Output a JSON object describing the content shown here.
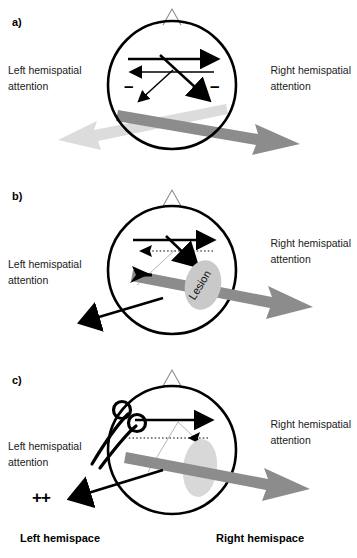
{
  "figure": {
    "background": "#ffffff"
  },
  "colors": {
    "stroke": "#000000",
    "dark_gray_arrow": "#8c8c8c",
    "light_gray_arrow": "#dcdcdc",
    "lesion_fill_b": "#c9c9c9",
    "lesion_fill_c": "#d8d8d8",
    "faint_line": "#b5b5b5",
    "nose_stroke": "#8a8a8a",
    "text": "#1a1a1a"
  },
  "panels": [
    {
      "id": "a",
      "label": "a)",
      "left_label_line1": "Left hemispatial",
      "left_label_line2": "attention",
      "right_label_line1": "Right hemispatial",
      "right_label_line2": "attention",
      "minus_left": "–",
      "minus_right": "–",
      "description": "Intact brain: balanced reciprocal inhibition between hemispheres",
      "internal_arrows": [
        {
          "name": "top-rightward-arrow",
          "direction": "right",
          "style": "solid"
        },
        {
          "name": "second-leftward-arrow",
          "direction": "left",
          "style": "solid"
        },
        {
          "name": "diagonal-down-right-arrow",
          "direction": "down-right",
          "style": "solid"
        },
        {
          "name": "diagonal-down-left-arrow",
          "direction": "down-left",
          "style": "solid"
        }
      ],
      "gray_arrows": [
        {
          "name": "right-attention-vector",
          "color": "dark",
          "direction": "down-right"
        },
        {
          "name": "left-attention-vector",
          "color": "light",
          "direction": "down-left"
        }
      ],
      "lesion": null,
      "scissors": false,
      "plus_marks": null
    },
    {
      "id": "b",
      "label": "b)",
      "left_label_line1": "Left hemispatial",
      "left_label_line2": "attention",
      "right_label_line1": "Right hemispatial",
      "right_label_line2": "attention",
      "minus_left": null,
      "minus_right": null,
      "description": "Right hemisphere lesion: loss of left hemispatial attention, rightward bias",
      "internal_arrows": [
        {
          "name": "top-rightward-arrow",
          "direction": "right",
          "style": "solid"
        },
        {
          "name": "second-leftward-arrow",
          "direction": "left",
          "style": "dotted"
        },
        {
          "name": "diagonal-down-right-arrow",
          "direction": "down-right",
          "style": "solid"
        },
        {
          "name": "diagonal-down-left-arrow",
          "direction": "down-left",
          "style": "faint"
        }
      ],
      "gray_arrows": [
        {
          "name": "right-attention-vector",
          "color": "dark",
          "direction": "down-right"
        }
      ],
      "lesion": {
        "name": "lesion-ellipse",
        "text": "Lesion",
        "rotation_deg": -58
      },
      "external_black_arrow": {
        "name": "deviation-arrow",
        "direction": "down-left"
      },
      "scissors": false,
      "plus_marks": null
    },
    {
      "id": "c",
      "label": "c)",
      "left_label_line1": "Left hemispatial",
      "left_label_line2": "attention",
      "right_label_line1": "Right hemispatial",
      "right_label_line2": "attention",
      "minus_left": null,
      "minus_right": null,
      "description": "Additional commissurotomy or callosal section releases left attention",
      "internal_arrows": [
        {
          "name": "top-rightward-arrow",
          "direction": "right",
          "style": "solid"
        },
        {
          "name": "second-leftward-arrow",
          "direction": "left",
          "style": "dotted"
        },
        {
          "name": "diagonal-down-right-arrow",
          "direction": "down-right",
          "style": "solid"
        },
        {
          "name": "diagonal-faint-lines",
          "direction": "down-left",
          "style": "faint"
        }
      ],
      "gray_arrows": [
        {
          "name": "right-attention-vector",
          "color": "dark",
          "direction": "down-right"
        }
      ],
      "lesion": {
        "name": "lesion-ellipse",
        "text": "",
        "rotation_deg": 0
      },
      "external_black_arrow": {
        "name": "deviation-arrow",
        "direction": "down-left"
      },
      "scissors": {
        "name": "scissors-icon",
        "label": "scissors"
      },
      "plus_marks": "++"
    }
  ],
  "footer": {
    "left": "Left hemispace",
    "right": "Right hemispace"
  }
}
